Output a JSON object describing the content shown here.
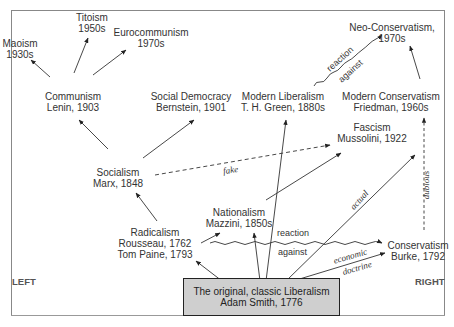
{
  "diagram": {
    "side_labels": {
      "left": "LEFT",
      "right": "RIGHT"
    },
    "root": {
      "line1": "The original, classic Liberalism",
      "line2": "Adam Smith, 1776"
    },
    "nodes": {
      "maoism": {
        "line1": "Maoism",
        "line2": "1930s"
      },
      "titoism": {
        "line1": "Titoism",
        "line2": "1950s"
      },
      "eurocommunism": {
        "line1": "Eurocommunism",
        "line2": "1970s"
      },
      "communism": {
        "line1": "Communism",
        "line2": "Lenin, 1903"
      },
      "social_democracy": {
        "line1": "Social Democracy",
        "line2": "Bernstein, 1901"
      },
      "modern_liberalism": {
        "line1": "Modern Liberalism",
        "line2": "T. H. Green, 1880s"
      },
      "neo_conservatism": {
        "line1": "Neo-Conservatism,",
        "line2": "1970s"
      },
      "modern_conservatism": {
        "line1": "Modern Conservatism",
        "line2": "Friedman, 1960s"
      },
      "socialism": {
        "line1": "Socialism",
        "line2": "Marx, 1848"
      },
      "fascism": {
        "line1": "Fascism",
        "line2": "Mussolini, 1922"
      },
      "nationalism": {
        "line1": "Nationalism",
        "line2": "Mazzini, 1850s"
      },
      "radicalism": {
        "line1": "Radicalism",
        "line2": "Rousseau, 1762",
        "line3": "Tom Paine, 1793"
      },
      "conservatism": {
        "line1": "Conservatism",
        "line2": "Burke, 1792"
      }
    },
    "edge_labels": {
      "fake": "fake",
      "actual": "actual",
      "dubious": "dubious",
      "economic": "economic",
      "doctrine": "doctrine",
      "reaction_lower": "reaction",
      "against_lower": "against",
      "reaction_upper": "reaction",
      "against_upper": "against"
    },
    "colors": {
      "root_fill": "#cfcfcf",
      "line": "#333333",
      "frame": "#888888"
    }
  }
}
